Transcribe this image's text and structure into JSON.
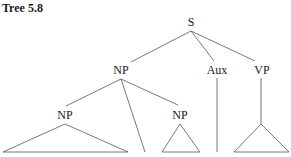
{
  "title": "Tree 5.8",
  "tree": {
    "root": {
      "label": "S"
    },
    "nodes": {
      "np_top": {
        "label": "NP"
      },
      "aux": {
        "label": "Aux"
      },
      "vp": {
        "label": "VP"
      },
      "np_left": {
        "label": "NP"
      },
      "np_small": {
        "label": "NP"
      }
    },
    "structure": "[S [NP [NP △] | [NP △]] [Aux |] [VP △]]"
  },
  "colors": {
    "line": "#555555",
    "text": "#1a1a1a",
    "background": "#ffffff"
  }
}
